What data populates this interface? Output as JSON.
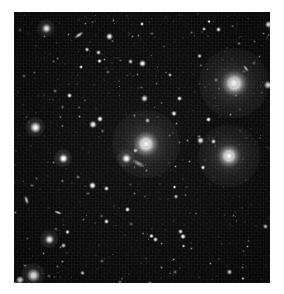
{
  "image": {
    "kind": "astronomical-deep-field",
    "subject": "galaxy cluster field",
    "alt_text": "Deep sky astronomical image of a galaxy cluster: a dense field of faint point sources on a black background with several bright elliptical galaxies showing extended halos.",
    "page_background": "#ffffff",
    "field": {
      "background": "#080808",
      "left": 14,
      "top": 12,
      "width": 256,
      "height": 271
    }
  },
  "objects": {
    "bright_galaxies": [
      {
        "name": "galaxy-upper-right",
        "x": 234,
        "y": 83,
        "size": 27,
        "brightness": 1.0
      },
      {
        "name": "galaxy-center",
        "x": 146,
        "y": 144,
        "size": 26,
        "brightness": 0.95
      },
      {
        "name": "galaxy-right-mid",
        "x": 229,
        "y": 156,
        "size": 24,
        "brightness": 0.92
      }
    ],
    "bright_stars": [
      {
        "name": "star-left-mid",
        "x": 35,
        "y": 127,
        "size": 11
      },
      {
        "name": "star-lower-left",
        "x": 33,
        "y": 275,
        "size": 13
      },
      {
        "name": "star-upper-left",
        "x": 46,
        "y": 28,
        "size": 9
      },
      {
        "name": "star-left-lower",
        "x": 49,
        "y": 239,
        "size": 9
      },
      {
        "name": "star-mid-left",
        "x": 63,
        "y": 158,
        "size": 9
      },
      {
        "name": "star-center-low",
        "x": 126,
        "y": 158,
        "size": 9
      }
    ],
    "edge_on_galaxies": [
      {
        "name": "edge-on-top-left",
        "x": 79,
        "y": 35,
        "w": 10,
        "h": 4,
        "rot": -35
      },
      {
        "name": "edge-on-left-mid",
        "x": 26,
        "y": 200,
        "w": 9,
        "h": 4,
        "rot": 72
      },
      {
        "name": "edge-on-mid",
        "x": 58,
        "y": 212,
        "w": 8,
        "h": 3,
        "rot": 20
      },
      {
        "name": "edge-on-right",
        "x": 246,
        "y": 68,
        "w": 8,
        "h": 3,
        "rot": 55
      }
    ],
    "lensing_arc": {
      "name": "arc-near-central-galaxy",
      "x": 138,
      "y": 163,
      "w": 13,
      "h": 5,
      "rot": 28
    },
    "counts": {
      "bright_galaxies": 3,
      "bright_stars": 6,
      "edge_on_galaxies": 4,
      "point_sources_total": 430
    }
  },
  "colors": {
    "sky": "#080808",
    "star_core": "#ffffff",
    "margin": "#ffffff"
  }
}
